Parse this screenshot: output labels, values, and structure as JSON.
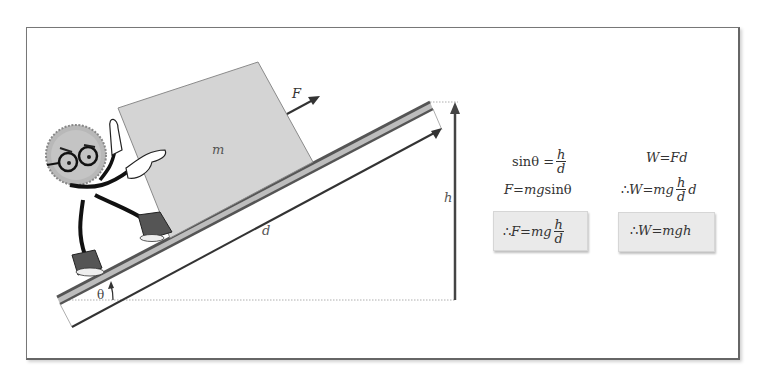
{
  "diagram": {
    "labels": {
      "force": "F",
      "mass": "m",
      "distance": "d",
      "height": "h",
      "angle": "θ"
    },
    "character": "cartoon sun-shaped character with glasses pushing block",
    "colors": {
      "block_fill": "#d4d4d4",
      "block_stroke": "#8a8a8a",
      "ramp_stroke": "#555555",
      "ramp_inner": "#bdbdbd",
      "arrow": "#333333",
      "highlight_box": "#eaeaea"
    }
  },
  "equations": {
    "left": {
      "line1": {
        "lhs": "sinθ =",
        "num": "h",
        "den": "d"
      },
      "line2": {
        "text_a": "F",
        "text_b": " = ",
        "text_c": "mg",
        "text_d": " sinθ"
      },
      "result": {
        "prefix": "∴ ",
        "lhs": "F",
        "eq": " = ",
        "mg": "mg",
        "num": "h",
        "den": "d"
      }
    },
    "right": {
      "line1": {
        "lhs": "W",
        "eq": " = ",
        "rhs": "Fd"
      },
      "line2": {
        "prefix": "∴ ",
        "lhs": "W",
        "eq": " = ",
        "mg": "mg",
        "num": "h",
        "den": "d",
        "tail": "d"
      },
      "result": {
        "prefix": "∴ ",
        "lhs": "W",
        "eq": " = ",
        "rhs": "mgh"
      }
    }
  }
}
